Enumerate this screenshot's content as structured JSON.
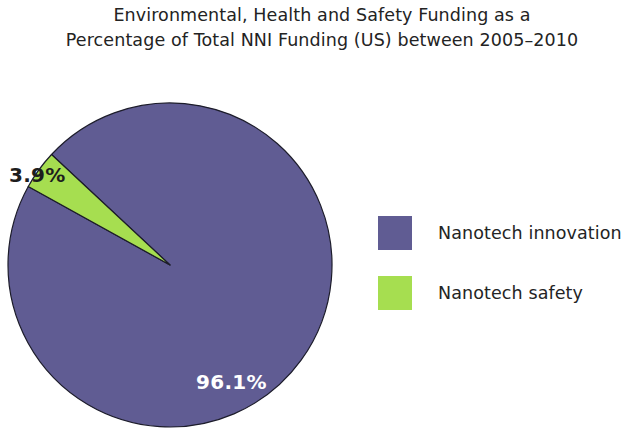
{
  "chart_data": {
    "type": "pie",
    "title": "Environmental, Health and Safety Funding as a Percentage of Total NNI Funding (US) between 2005–2010",
    "title_lines": [
      "Environmental, Health and Safety Funding as a",
      "Percentage of Total NNI Funding (US) between 2005–2010"
    ],
    "categories": [
      "Nanotech innovation",
      "Nanotech safety"
    ],
    "values": [
      96.1,
      3.9
    ],
    "value_labels": [
      "96.1%",
      "3.9%"
    ],
    "unit": "percent",
    "colors": [
      "#605C93",
      "#A6DE50"
    ],
    "legend_position": "right",
    "start_angle_deg": 313.0,
    "slice_angles_deg": [
      345.96,
      14.04
    ],
    "xlabel": "",
    "ylabel": "",
    "grid": false
  },
  "title": {
    "line1": "Environmental, Health and Safety Funding as a",
    "line2": "Percentage of Total NNI Funding (US) between 2005–2010"
  },
  "pie": {
    "labels": {
      "safety": "3.9%",
      "innovation": "96.1%"
    }
  },
  "legend": {
    "items": [
      {
        "label": "Nanotech innovation",
        "color": "#605C93"
      },
      {
        "label": "Nanotech safety",
        "color": "#A6DE50"
      }
    ]
  },
  "colors": {
    "innovation": "#605C93",
    "safety": "#A6DE50",
    "background": "#FFFFFF",
    "text": "#232323",
    "label_on_slice": "#FFFFFF"
  }
}
